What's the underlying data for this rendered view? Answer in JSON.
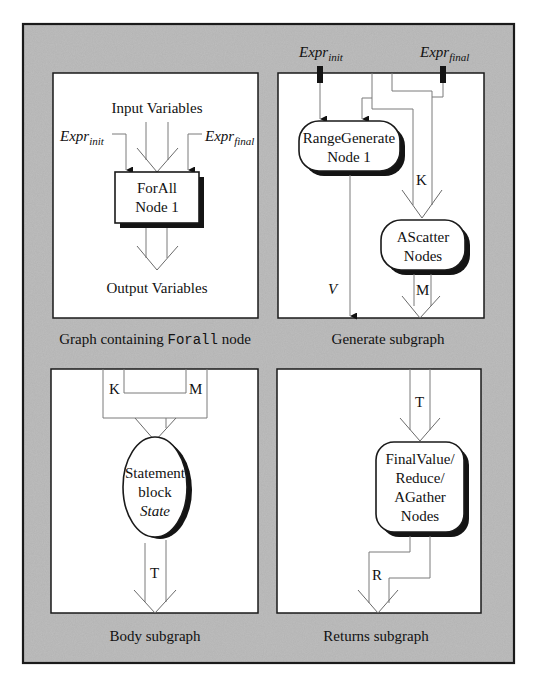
{
  "figure": {
    "background_color": "#b3b3b3",
    "panel_color": "#ffffff",
    "panels": [
      {
        "id": "forall-graph",
        "caption_prefix": "Graph containing ",
        "caption_code": "Forall",
        "caption_suffix": " node",
        "labels": {
          "input": "Input Variables",
          "output": "Output Variables",
          "expr_init_base": "Expr",
          "expr_init_sub": "init",
          "expr_final_base": "Expr",
          "expr_final_sub": "final"
        },
        "node": {
          "line1": "ForAll",
          "line2": "Node 1"
        }
      },
      {
        "id": "generate-subgraph",
        "caption": "Generate subgraph",
        "labels": {
          "expr_init_base": "Expr",
          "expr_init_sub": "init",
          "expr_final_base": "Expr",
          "expr_final_sub": "final",
          "k": "K",
          "m": "M",
          "v": "V"
        },
        "range_node": {
          "line1": "RangeGenerate",
          "line2": "Node 1"
        },
        "scatter_node": {
          "line1": "AScatter",
          "line2": "Nodes"
        }
      },
      {
        "id": "body-subgraph",
        "caption": "Body subgraph",
        "labels": {
          "k": "K",
          "m": "M",
          "t": "T"
        },
        "node": {
          "line1": "Statement",
          "line2": "block",
          "line3": "State"
        }
      },
      {
        "id": "returns-subgraph",
        "caption": "Returns subgraph",
        "labels": {
          "t": "T",
          "r": "R"
        },
        "node": {
          "line1": "FinalValue/",
          "line2": "Reduce/",
          "line3": "AGather",
          "line4": "Nodes"
        }
      }
    ]
  }
}
